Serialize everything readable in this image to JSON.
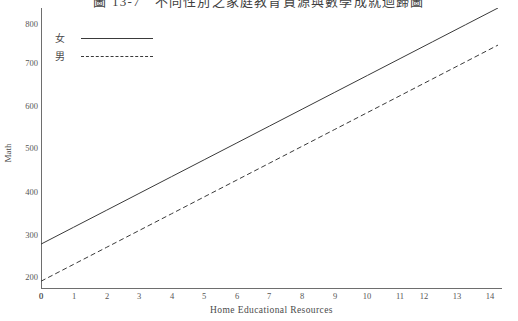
{
  "figure": {
    "title": "圖 13-7　不同性別之家庭教育資源與數學成就迴歸圖",
    "background_color": "#ffffff",
    "axis_color": "#6e6e6e",
    "line_color": "#3a3a3a"
  },
  "chart_data": {
    "type": "line",
    "title": "圖 13-7　不同性別之家庭教育資源與數學成就迴歸圖",
    "xlabel": "Home Educational Resources",
    "ylabel": "Math",
    "xlim": [
      0,
      14
    ],
    "ylim": [
      160,
      850
    ],
    "grid": false,
    "legend_position": "top-left",
    "x_ticks": [
      "0",
      "1",
      "2",
      "3",
      "4",
      "5",
      "6",
      "7",
      "8",
      "9",
      "10",
      "11",
      "12",
      "13",
      "14"
    ],
    "y_ticks": [
      "200",
      "300",
      "400",
      "500",
      "600",
      "700",
      "800"
    ],
    "origin_label": "0",
    "x": [
      0,
      1,
      2,
      3,
      4,
      5,
      6,
      7,
      8,
      9,
      10,
      11,
      12,
      13,
      14
    ],
    "series": [
      {
        "name": "女",
        "style": "solid",
        "values": [
          278,
          318,
          358,
          398,
          438,
          478,
          518,
          558,
          598,
          638,
          678,
          718,
          758,
          798,
          838
        ]
      },
      {
        "name": "男",
        "style": "dashed",
        "values": [
          190,
          230,
          270,
          310,
          350,
          390,
          430,
          470,
          510,
          550,
          590,
          630,
          670,
          710,
          750
        ]
      }
    ]
  },
  "legend": {
    "items": [
      {
        "label": "女",
        "style": "solid"
      },
      {
        "label": "男",
        "style": "dashed"
      }
    ]
  }
}
